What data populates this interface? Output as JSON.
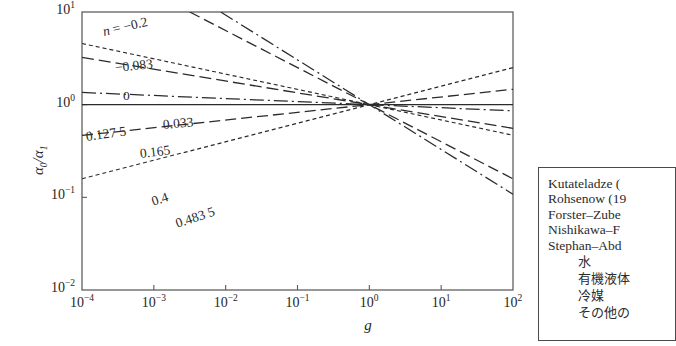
{
  "chart_data": {
    "type": "line",
    "title": "",
    "xlabel": "g",
    "ylabel": "a0/a1",
    "ylabel_parts": {
      "main": "α",
      "sub1": "0",
      "sep": "/",
      "main2": "α",
      "sub2": "1"
    },
    "xscale": "log",
    "yscale": "log",
    "xlim": [
      0.0001,
      100
    ],
    "ylim": [
      0.01,
      10
    ],
    "grid": false,
    "legend_position": "outside-right",
    "xticks": [
      {
        "value": 0.0001,
        "label": "10",
        "exp": "−4"
      },
      {
        "value": 0.001,
        "label": "10",
        "exp": "−3"
      },
      {
        "value": 0.01,
        "label": "10",
        "exp": "−2"
      },
      {
        "value": 0.1,
        "label": "10",
        "exp": "−1"
      },
      {
        "value": 1,
        "label": "10",
        "exp": "0"
      },
      {
        "value": 10,
        "label": "10",
        "exp": "1"
      },
      {
        "value": 100,
        "label": "10",
        "exp": "2"
      }
    ],
    "yticks": [
      {
        "value": 10,
        "label": "10",
        "exp": "1"
      },
      {
        "value": 1,
        "label": "10",
        "exp": "0"
      },
      {
        "value": 0.1,
        "label": "10",
        "exp": "−1"
      },
      {
        "value": 0.01,
        "label": "10",
        "exp": "−2"
      }
    ],
    "note": "Each curve is a power law a0/a1 = g^(-n) passing through (g=1, a0/a1=1). n is the exponent annotated on each line.",
    "series": [
      {
        "name": "n = −0.2",
        "n": -0.2,
        "label": "n = −0.2",
        "label_prefix": "n = ",
        "label_value": "−0.2",
        "dash": "4,3",
        "width": 1.15
      },
      {
        "name": "−0.083",
        "n": -0.083,
        "label": "−0.083",
        "label_prefix": "",
        "label_value": "−0.083",
        "dash": "11,5",
        "width": 1.3
      },
      {
        "name": "0",
        "n": 0,
        "label": "0",
        "label_prefix": "",
        "label_value": "0",
        "dash": "none",
        "width": 1.3
      },
      {
        "name": "0.033",
        "n": 0.033,
        "label": "0.033",
        "label_prefix": "",
        "label_value": "0.033",
        "dash": "14,4,2,4",
        "width": 1.25
      },
      {
        "name": "0.127 5",
        "n": 0.1275,
        "label": "0.127 5",
        "label_prefix": "",
        "label_value": "0.127 5",
        "dash": "12,5",
        "width": 1.3
      },
      {
        "name": "0.165",
        "n": 0.165,
        "label": "0.165",
        "label_prefix": "",
        "label_value": "0.165",
        "dash": "4,3",
        "width": 1.15
      },
      {
        "name": "0.4",
        "n": 0.4,
        "label": "0.4",
        "label_prefix": "",
        "label_value": "0.4",
        "dash": "11,5",
        "width": 1.3
      },
      {
        "name": "0.483 5",
        "n": 0.4835,
        "label": "0.483 5",
        "label_prefix": "",
        "label_value": "0.483 5",
        "dash": "14,4,2,4",
        "width": 1.25
      }
    ]
  },
  "legend": {
    "rows": [
      {
        "text": "Kutateladze ("
      },
      {
        "text": "Rohsenow (19"
      },
      {
        "text": "Forster–Zube"
      },
      {
        "text": "Nishikawa–F"
      },
      {
        "text": "Stephan–Abd"
      }
    ],
    "jp_rows": [
      {
        "text": "水"
      },
      {
        "text": "有機液体"
      },
      {
        "text": "冷媒"
      },
      {
        "text": "その他の"
      }
    ]
  },
  "colors": {
    "line": "#2b2b2b",
    "axis": "#5a5a5a",
    "text": "#262626",
    "legend_border": "#4a4a4a",
    "background": "#ffffff"
  }
}
